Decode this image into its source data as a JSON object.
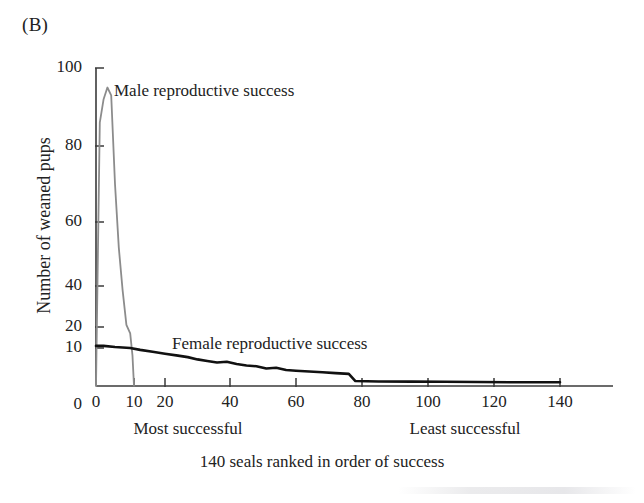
{
  "figure": {
    "panel_label": "(B)",
    "caption": "140 seals ranked in order of success"
  },
  "axes": {
    "y_title": "Number of weaned pups",
    "x_note_left": "Most successful",
    "x_note_right": "Least successful"
  },
  "series_labels": {
    "male": "Male reproductive success",
    "female": "Female reproductive success"
  },
  "colors": {
    "male_line": "#8c8c8c",
    "female_line": "#111111",
    "axis": "#3a3a3a",
    "text": "#222222",
    "background": "#ffffff"
  },
  "chart_data": {
    "type": "line",
    "title": "",
    "subtitle": "",
    "xlabel": "140 seals ranked in order of success",
    "ylabel": "Number of weaned pups",
    "xlim": [
      0,
      140
    ],
    "ylim": [
      0,
      100
    ],
    "grid": false,
    "legend": "inline-annotations",
    "x_scale": "compressed-low-end",
    "y_scale": "compressed-low-end",
    "xticks": [
      0,
      10,
      20,
      40,
      60,
      80,
      100,
      120,
      140
    ],
    "xticklabels": [
      "0",
      "10",
      "20",
      "40",
      "60",
      "80",
      "100",
      "120",
      "140"
    ],
    "yticks": [
      0,
      10,
      20,
      40,
      60,
      80,
      100
    ],
    "yticklabels": [
      "0",
      "10",
      "20",
      "40",
      "60",
      "80",
      "100"
    ],
    "annotations": [
      {
        "text": "Male reproductive success",
        "x": 14,
        "y": 88
      },
      {
        "text": "Female reproductive success",
        "x": 30,
        "y": 10
      },
      {
        "text": "Most successful",
        "x": 28,
        "y": -14
      },
      {
        "text": "Least successful",
        "x": 101,
        "y": -14
      }
    ],
    "series": [
      {
        "name": "Male reproductive success",
        "color": "#8c8c8c",
        "x": [
          1,
          2,
          3,
          4,
          5,
          6,
          7,
          8,
          9,
          9.6,
          10
        ],
        "values": [
          86,
          92,
          95,
          93,
          70,
          52,
          38,
          21,
          17,
          8,
          0
        ]
      },
      {
        "name": "Female reproductive success",
        "color": "#111111",
        "x": [
          0,
          2,
          5,
          9,
          12,
          16,
          20,
          24,
          27,
          30,
          33,
          36,
          39,
          42,
          45,
          48,
          51,
          54,
          57,
          60,
          64,
          68,
          72,
          76,
          78,
          85,
          95,
          105,
          115,
          125,
          135,
          140
        ],
        "values": [
          11,
          11,
          10.5,
          10,
          9.5,
          9,
          8.5,
          8,
          7.6,
          7,
          6.6,
          6.2,
          6.4,
          5.8,
          5.4,
          5.2,
          4.6,
          4.8,
          4.2,
          4,
          3.8,
          3.6,
          3.4,
          3.2,
          1.3,
          1.2,
          1.15,
          1.1,
          1.05,
          1,
          1,
          1
        ]
      }
    ]
  }
}
